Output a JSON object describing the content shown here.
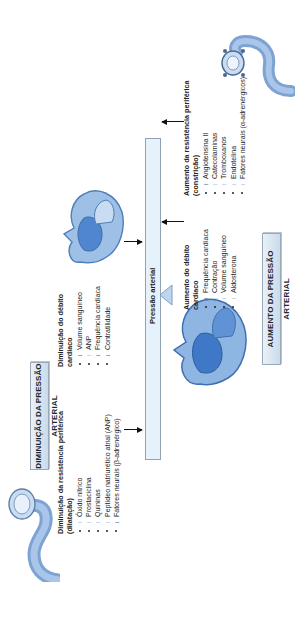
{
  "colors": {
    "arrow_dark": "#2f6fb5",
    "arrow_light": "#9cc3e6",
    "bar_fill": "#e6f2fb",
    "title_fill": "#d6e4f0",
    "vessel": "#8fb2dd",
    "heart": "#5a8fd0"
  },
  "decrease": {
    "title": "DIMINUIÇÃO DA PRESSÃO ARTERIAL",
    "resistance": {
      "heading_line1": "Diminuição da resistência periférica",
      "heading_line2": "(dilatação)",
      "items": [
        {
          "arrow": "light",
          "label": "Óxido nítrico"
        },
        {
          "arrow": "light",
          "label": "Prostaciclina"
        },
        {
          "arrow": "light",
          "label": "Quininas"
        },
        {
          "arrow": "light",
          "label": "Peptídeo natriurético atrial (ANP)"
        },
        {
          "arrow": "dark",
          "label": "Fatores neurais (β-adrenérgico)"
        }
      ]
    },
    "output": {
      "heading_line1": "Diminuição do débito",
      "heading_line2": "cardíaco",
      "items": [
        {
          "arrow": "dark",
          "label": "Volume sanguíneo"
        },
        {
          "arrow": "light",
          "label": "ANP"
        },
        {
          "arrow": "dark",
          "label": "Frequência cardíaca"
        },
        {
          "arrow": "dark",
          "label": "Contratilidade"
        }
      ]
    }
  },
  "center": {
    "bar_label": "Pressão arterial"
  },
  "increase": {
    "title": "AUMENTO DA PRESSÃO ARTERIAL",
    "output": {
      "heading_line1": "Aumento do débito",
      "heading_line2": "cardíaco",
      "items": [
        {
          "arrow": "dark",
          "label": "Frequência cardíaca"
        },
        {
          "arrow": "light",
          "label": "Contração"
        },
        {
          "arrow": "light",
          "label": "Volume sanguíneo"
        },
        {
          "arrow": "light",
          "label": "Aldosterona"
        }
      ]
    },
    "resistance": {
      "heading_line1": "Aumento da resistência periférica",
      "heading_line2": "(constrição)",
      "items": [
        {
          "arrow": "dark",
          "label": "Angiotensina II"
        },
        {
          "arrow": "light",
          "label": "Catecolaminas"
        },
        {
          "arrow": "light",
          "label": "Tromboxanos"
        },
        {
          "arrow": "light",
          "label": "Endotelina"
        },
        {
          "arrow": "light",
          "label": "Fatores neurais (α-adrenérgicos)"
        }
      ]
    }
  },
  "icons": {
    "up_arrow": "↑"
  }
}
